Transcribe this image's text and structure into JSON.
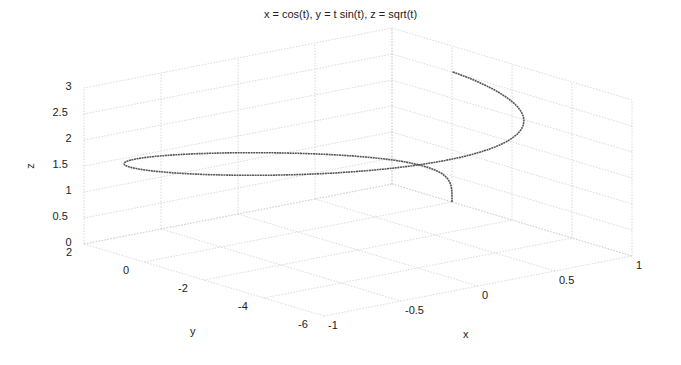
{
  "chart_data": {
    "type": "line",
    "projection": "3d",
    "title": "x = cos(t), y = t sin(t), z = sqrt(t)",
    "xlabel": "x",
    "ylabel": "y",
    "zlabel": "z",
    "parametric": {
      "x": "cos(t)",
      "y": "t sin(t)",
      "z": "sqrt(t)",
      "t_range": [
        0,
        6.2832
      ],
      "samples": 400
    },
    "xlim": [
      -1,
      1
    ],
    "ylim": [
      -6,
      2
    ],
    "zlim": [
      0,
      3
    ],
    "xticks": [
      "-1",
      "-0.5",
      "0",
      "0.5",
      "1"
    ],
    "yticks": [
      "2",
      "0",
      "-2",
      "-4",
      "-6"
    ],
    "zticks": [
      "0",
      "0.5",
      "1",
      "1.5",
      "2",
      "2.5",
      "3"
    ],
    "grid": true,
    "line_color": "#555555",
    "grid_color": "#cfcfcf"
  }
}
